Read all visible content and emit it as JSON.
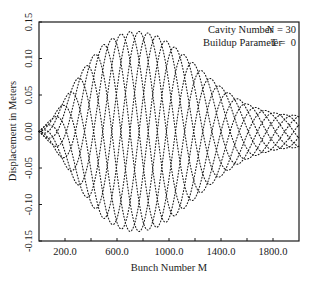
{
  "chart_data": {
    "type": "line",
    "title": "",
    "xlabel": "Bunch Number M",
    "ylabel": "Displacement in Meters",
    "xlim": [
      0,
      2000
    ],
    "ylim": [
      -0.15,
      0.15
    ],
    "grid": false,
    "xticks": [
      200,
      400,
      600,
      800,
      1000,
      1200,
      1400,
      1600,
      1800
    ],
    "xtick_labels": [
      "200.0",
      "",
      "600.0",
      "",
      "1000.0",
      "",
      "1400.0",
      "",
      "1800.0"
    ],
    "yticks": [
      -0.15,
      -0.1,
      -0.05,
      0.0,
      0.05,
      0.1,
      0.15
    ],
    "ytick_labels": [
      "-0.15",
      "-0.10",
      "-0.05",
      "0.00",
      "0.05",
      "0.10",
      "0.15"
    ],
    "legend": {
      "position": "upper right",
      "lines": [
        {
          "label": "Cavity Number",
          "value": "N = 30"
        },
        {
          "label": "Buildup Parameter",
          "value": "T =  0"
        }
      ]
    },
    "style": "dotted curves forming a lattice of oscillations",
    "model": {
      "description": "Family of oscillating bunch-displacement curves y = A(M) * sin(2*pi*M/period + phase_k)",
      "num_curves": 8,
      "period": 560,
      "envelope_points": [
        [
          0,
          0.0
        ],
        [
          100,
          0.018
        ],
        [
          200,
          0.045
        ],
        [
          300,
          0.075
        ],
        [
          400,
          0.1
        ],
        [
          500,
          0.12
        ],
        [
          600,
          0.132
        ],
        [
          700,
          0.137
        ],
        [
          800,
          0.137
        ],
        [
          900,
          0.132
        ],
        [
          1000,
          0.122
        ],
        [
          1100,
          0.108
        ],
        [
          1200,
          0.092
        ],
        [
          1300,
          0.076
        ],
        [
          1400,
          0.061
        ],
        [
          1500,
          0.048
        ],
        [
          1600,
          0.038
        ],
        [
          1700,
          0.031
        ],
        [
          1800,
          0.026
        ],
        [
          1900,
          0.023
        ],
        [
          2000,
          0.022
        ]
      ]
    }
  },
  "plot": {
    "frame": {
      "x": 39,
      "y": 22,
      "width": 260,
      "height": 219
    },
    "ink_color": "#1a1a1a",
    "background": "#ffffff"
  }
}
